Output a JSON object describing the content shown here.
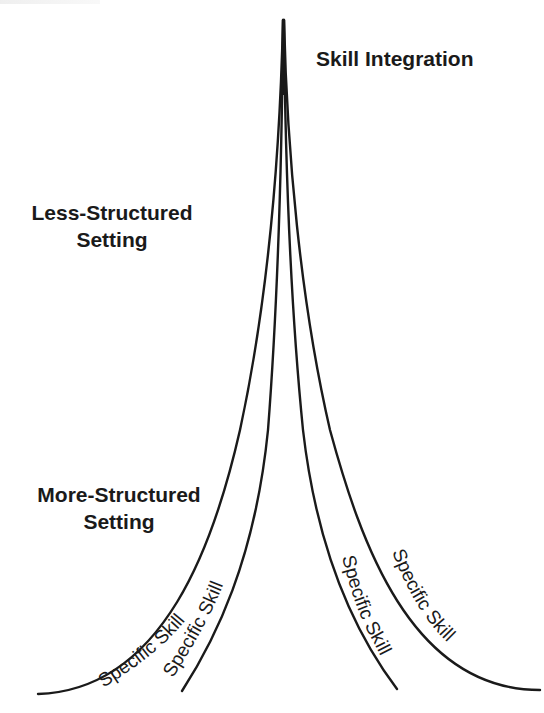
{
  "diagram": {
    "apex_label": "Skill Integration",
    "left_labels": {
      "less_structured": {
        "line1": "Less-Structured",
        "line2": "Setting"
      },
      "more_structured": {
        "line1": "More-Structured",
        "line2": "Setting"
      }
    },
    "branches": [
      {
        "label": "Specific Skill",
        "side": "left-outer"
      },
      {
        "label": "Specific Skill",
        "side": "left-inner"
      },
      {
        "label": "Specific Skill",
        "side": "right-inner"
      },
      {
        "label": "Specific Skill",
        "side": "right-outer"
      }
    ],
    "colors": {
      "line": "#1a1a1a",
      "text": "#1a1a1a",
      "background": "#ffffff"
    }
  }
}
